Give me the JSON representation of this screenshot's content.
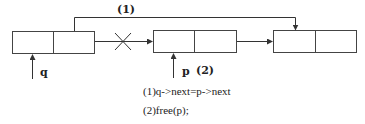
{
  "diagram": {
    "type": "linked-list-deletion",
    "nodes": [
      {
        "id": "node-q",
        "cells": 2
      },
      {
        "id": "node-p",
        "cells": 2
      },
      {
        "id": "node-next",
        "cells": 2
      }
    ],
    "top_link_label": "(1)",
    "pointers": [
      {
        "name": "q",
        "label": "q"
      },
      {
        "name": "p",
        "label": "p"
      }
    ],
    "step_label_near_p": "(2)",
    "crossed_link": true,
    "colors": {
      "line": "#333333",
      "background": "#ffffff"
    }
  },
  "steps": [
    {
      "num": "(1)",
      "code": "q->next=p->next"
    },
    {
      "num": "(2)",
      "code": "free(p);"
    }
  ]
}
